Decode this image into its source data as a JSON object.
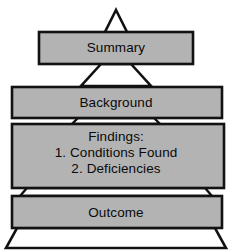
{
  "diagram": {
    "type": "pyramid",
    "title": "",
    "shape_color": "#b3b3b3",
    "outline_color": "#121212",
    "background_color": "#ffffff",
    "levels": [
      {
        "name": "summary",
        "label": "Summary",
        "order": 1,
        "lines": [
          "Summary"
        ]
      },
      {
        "name": "background",
        "label": "Background",
        "order": 2,
        "lines": [
          "Background"
        ]
      },
      {
        "name": "findings",
        "label": "Findings:",
        "order": 3,
        "lines": [
          "Findings:",
          "1. Conditions Found",
          "2. Deficiencies"
        ],
        "items": [
          {
            "number": "1.",
            "text": "Conditions Found"
          },
          {
            "number": "2.",
            "text": "Deficiencies"
          }
        ]
      },
      {
        "name": "outcome",
        "label": "Outcome",
        "order": 4,
        "lines": [
          "Outcome"
        ]
      }
    ],
    "findings_line_1": "Findings:",
    "findings_line_2": "1. Conditions Found",
    "findings_line_3": "2. Deficiencies"
  }
}
